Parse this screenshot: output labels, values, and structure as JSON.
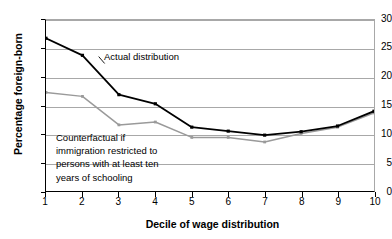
{
  "chart_data": {
    "type": "line",
    "title": "",
    "xlabel": "Decile of wage distribution",
    "ylabel": "Percentage foreign-born",
    "categories": [
      "1",
      "2",
      "3",
      "4",
      "5",
      "6",
      "7",
      "8",
      "9",
      "10"
    ],
    "x": [
      1,
      2,
      3,
      4,
      5,
      6,
      7,
      8,
      9,
      10
    ],
    "xlim": [
      1,
      10
    ],
    "ylim": [
      0,
      30
    ],
    "yticks": [
      0,
      5,
      10,
      15,
      20,
      25,
      30
    ],
    "ytick_labels": [
      "0",
      "5",
      "10",
      "15",
      "20",
      "25",
      "30"
    ],
    "xticks": [
      1,
      2,
      3,
      4,
      5,
      6,
      7,
      8,
      9,
      10
    ],
    "xtick_labels": [
      "1",
      "2",
      "3",
      "4",
      "5",
      "6",
      "7",
      "8",
      "9",
      "10"
    ],
    "grid": "horizontal",
    "legend_position": "inline-annotations",
    "series": [
      {
        "name": "Actual distribution",
        "color": "#000000",
        "marker": "square",
        "values": [
          26.8,
          23.8,
          16.9,
          15.3,
          11.2,
          10.5,
          9.8,
          10.4,
          11.4,
          14.0
        ]
      },
      {
        "name": "Counterfactual if immigration restricted to persons with at least ten years of schooling",
        "color": "#9a9a9a",
        "marker": "square",
        "values": [
          17.3,
          16.6,
          11.6,
          12.1,
          9.4,
          9.4,
          8.6,
          10.1,
          11.2,
          13.7
        ]
      }
    ],
    "annotations": [
      {
        "id": "actual",
        "lines": [
          "Actual distribution"
        ],
        "target_series": "Actual distribution"
      },
      {
        "id": "counterfactual",
        "lines": [
          "Counterfactual if",
          "immigration restricted to",
          "persons with at least ten",
          "years of schooling"
        ],
        "target_series": "Counterfactual if immigration restricted to persons with at least ten years of schooling"
      }
    ]
  },
  "colors": {
    "actual_line": "#000000",
    "counterfactual_line": "#9a9a9a",
    "gridline": "#a8a8a8",
    "axis": "#000000",
    "background": "#ffffff"
  }
}
